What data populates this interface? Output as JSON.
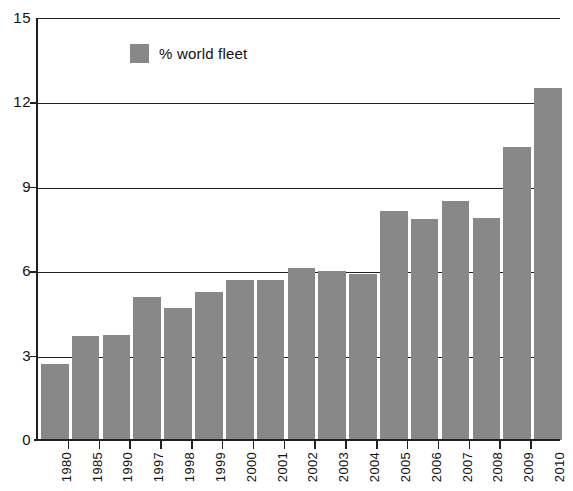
{
  "chart_data": {
    "type": "bar",
    "title": "",
    "xlabel": "",
    "ylabel": "",
    "categories": [
      "1980",
      "1985",
      "1990",
      "1997",
      "1998",
      "1999",
      "2000",
      "2001",
      "2002",
      "2003",
      "2004",
      "2005",
      "2006",
      "2007",
      "2008",
      "2009",
      "2010"
    ],
    "values": [
      2.7,
      3.7,
      3.75,
      5.1,
      4.7,
      5.25,
      5.7,
      5.7,
      6.1,
      6.0,
      5.9,
      8.15,
      7.85,
      8.5,
      7.9,
      10.4,
      12.5
    ],
    "series": [
      {
        "name": "% world fleet",
        "values": [
          2.7,
          3.7,
          3.75,
          5.1,
          4.7,
          5.25,
          5.7,
          5.7,
          6.1,
          6.0,
          5.9,
          8.15,
          7.85,
          8.5,
          7.9,
          10.4,
          12.5
        ]
      }
    ],
    "ylim": [
      0,
      15
    ],
    "ytick_labels": [
      "0",
      "3",
      "6",
      "9",
      "12",
      "15"
    ],
    "ytick_values": [
      0,
      3,
      6,
      9,
      12,
      15
    ],
    "grid": true,
    "legend": {
      "position": "top-left-inside",
      "entries": [
        {
          "label": "% world fleet",
          "color": "#888888"
        }
      ]
    },
    "bar_color": "#888888",
    "axis_color": "#231f20"
  }
}
